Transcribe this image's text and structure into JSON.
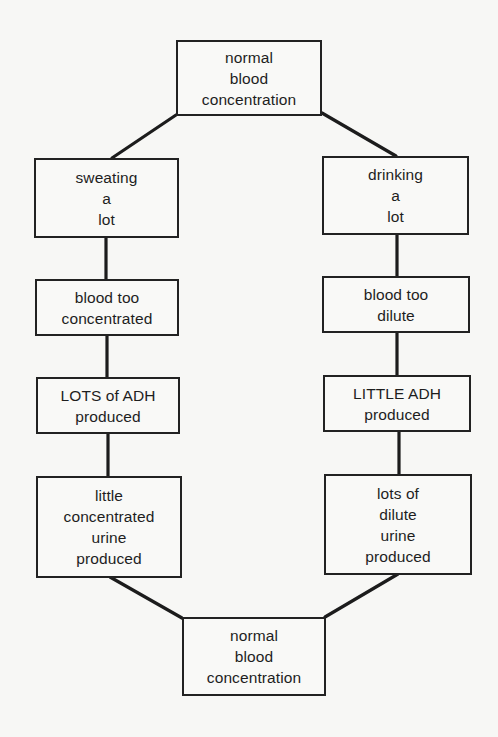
{
  "diagram": {
    "type": "flowchart-loop",
    "topic": "ADH regulation of blood concentration",
    "colors": {
      "background": "#f7f7f5",
      "line": "#1c1c1c",
      "text": "#1e1e1e"
    },
    "nodes": {
      "start": {
        "lines": [
          "normal",
          "blood",
          "concentration"
        ]
      },
      "left": [
        {
          "id": "sweating",
          "lines": [
            "sweating",
            "a",
            "lot"
          ]
        },
        {
          "id": "blood-concentrated",
          "lines": [
            "blood too",
            "concentrated"
          ]
        },
        {
          "id": "lots-adh",
          "lines": [
            "LOTS of ADH",
            "produced"
          ]
        },
        {
          "id": "concentrated-urine",
          "lines": [
            "little",
            "concentrated",
            "urine",
            "produced"
          ]
        }
      ],
      "right": [
        {
          "id": "drinking",
          "lines": [
            "drinking",
            "a",
            "lot"
          ]
        },
        {
          "id": "blood-dilute",
          "lines": [
            "blood too",
            "dilute"
          ]
        },
        {
          "id": "little-adh",
          "lines": [
            "LITTLE ADH",
            "produced"
          ]
        },
        {
          "id": "dilute-urine",
          "lines": [
            "lots of",
            "dilute",
            "urine",
            "produced"
          ]
        }
      ],
      "end": {
        "lines": [
          "normal",
          "blood",
          "concentration"
        ]
      }
    }
  }
}
